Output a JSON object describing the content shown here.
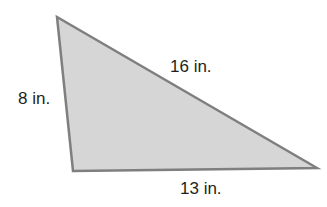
{
  "figure": {
    "type": "triangle",
    "fill_color": "#d6d6d6",
    "stroke_color": "#7f7f7f",
    "vertices": [
      [
        57,
        17
      ],
      [
        73,
        171
      ],
      [
        317,
        168
      ]
    ],
    "labels": {
      "left_side": "8 in.",
      "hypotenuse": "16 in.",
      "bottom_side": "13 in."
    }
  }
}
